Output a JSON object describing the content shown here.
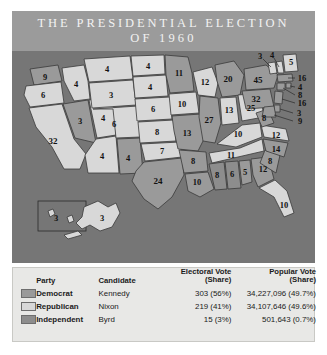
{
  "header": {
    "title_line1": "THE PRESIDENTIAL ELECTION",
    "title_line2": "OF 1960",
    "bar_color": "#9b9b9b"
  },
  "map": {
    "background_color": "#767676",
    "colors": {
      "democrat": "#9a9a9a",
      "republican": "#d8d8d8",
      "independent": "#8d8d8d",
      "border": "#3a3a3a"
    },
    "states": [
      {
        "code": "WA",
        "electoral_votes": "9",
        "party": "democrat"
      },
      {
        "code": "OR",
        "electoral_votes": "6",
        "party": "republican"
      },
      {
        "code": "CA",
        "electoral_votes": "32",
        "party": "republican"
      },
      {
        "code": "NV",
        "electoral_votes": "3",
        "party": "democrat"
      },
      {
        "code": "ID",
        "electoral_votes": "4",
        "party": "republican"
      },
      {
        "code": "UT",
        "electoral_votes": "4",
        "party": "republican"
      },
      {
        "code": "AZ",
        "electoral_votes": "4",
        "party": "republican"
      },
      {
        "code": "MT",
        "electoral_votes": "4",
        "party": "republican"
      },
      {
        "code": "WY",
        "electoral_votes": "3",
        "party": "republican"
      },
      {
        "code": "CO",
        "electoral_votes": "6",
        "party": "republican"
      },
      {
        "code": "NM",
        "electoral_votes": "4",
        "party": "democrat"
      },
      {
        "code": "ND",
        "electoral_votes": "4",
        "party": "republican"
      },
      {
        "code": "SD",
        "electoral_votes": "4",
        "party": "republican"
      },
      {
        "code": "NE",
        "electoral_votes": "6",
        "party": "republican"
      },
      {
        "code": "KS",
        "electoral_votes": "8",
        "party": "republican"
      },
      {
        "code": "OK",
        "electoral_votes": "7",
        "party": "republican"
      },
      {
        "code": "TX",
        "electoral_votes": "24",
        "party": "democrat"
      },
      {
        "code": "MN",
        "electoral_votes": "11",
        "party": "democrat"
      },
      {
        "code": "IA",
        "electoral_votes": "10",
        "party": "republican"
      },
      {
        "code": "MO",
        "electoral_votes": "13",
        "party": "democrat"
      },
      {
        "code": "AR",
        "electoral_votes": "8",
        "party": "democrat"
      },
      {
        "code": "LA",
        "electoral_votes": "10",
        "party": "democrat"
      },
      {
        "code": "WI",
        "electoral_votes": "12",
        "party": "republican"
      },
      {
        "code": "IL",
        "electoral_votes": "27",
        "party": "democrat"
      },
      {
        "code": "MI",
        "electoral_votes": "20",
        "party": "democrat"
      },
      {
        "code": "IN",
        "electoral_votes": "13",
        "party": "republican"
      },
      {
        "code": "OH",
        "electoral_votes": "25",
        "party": "republican"
      },
      {
        "code": "KY",
        "electoral_votes": "10",
        "party": "republican"
      },
      {
        "code": "TN",
        "electoral_votes": "11",
        "party": "republican"
      },
      {
        "code": "MS",
        "electoral_votes": "8",
        "party": "independent"
      },
      {
        "code": "AL-D",
        "electoral_votes": "6",
        "party": "independent"
      },
      {
        "code": "AL-R",
        "electoral_votes": "5",
        "party": "democrat"
      },
      {
        "code": "GA",
        "electoral_votes": "12",
        "party": "democrat"
      },
      {
        "code": "FL",
        "electoral_votes": "10",
        "party": "republican"
      },
      {
        "code": "SC",
        "electoral_votes": "8",
        "party": "democrat"
      },
      {
        "code": "NC",
        "electoral_votes": "14",
        "party": "democrat"
      },
      {
        "code": "VA",
        "electoral_votes": "12",
        "party": "republican"
      },
      {
        "code": "WV",
        "electoral_votes": "8",
        "party": "democrat"
      },
      {
        "code": "PA",
        "electoral_votes": "32",
        "party": "democrat"
      },
      {
        "code": "NY",
        "electoral_votes": "45",
        "party": "democrat"
      },
      {
        "code": "VT",
        "electoral_votes": "3",
        "party": "republican"
      },
      {
        "code": "NH",
        "electoral_votes": "4",
        "party": "republican"
      },
      {
        "code": "ME",
        "electoral_votes": "5",
        "party": "republican"
      },
      {
        "code": "MA",
        "electoral_votes": "16",
        "party": "democrat"
      },
      {
        "code": "RI",
        "electoral_votes": "4",
        "party": "democrat"
      },
      {
        "code": "CT",
        "electoral_votes": "8",
        "party": "democrat"
      },
      {
        "code": "NJ",
        "electoral_votes": "16",
        "party": "democrat"
      },
      {
        "code": "DE",
        "electoral_votes": "3",
        "party": "democrat"
      },
      {
        "code": "MD",
        "electoral_votes": "9",
        "party": "democrat"
      },
      {
        "code": "AK",
        "electoral_votes": "3",
        "party": "republican"
      },
      {
        "code": "HI",
        "electoral_votes": "3",
        "party": "democrat"
      }
    ]
  },
  "legend": {
    "columns": {
      "swatch": "",
      "party": "Party",
      "candidate": "Candidate",
      "electoral_l1": "Electoral Vote",
      "electoral_l2": "(Share)",
      "popular_l1": "Popular Vote",
      "popular_l2": "(Share)"
    },
    "rows": [
      {
        "party": "Democrat",
        "candidate": "Kennedy",
        "electoral": "303 (56%)",
        "popular": "34,227,096 (49.7%)"
      },
      {
        "party": "Republican",
        "candidate": "Nixon",
        "electoral": "219 (41%)",
        "popular": "34,107,646 (49.6%)"
      },
      {
        "party": "Independent",
        "candidate": "Byrd",
        "electoral": "15 (3%)",
        "popular": "501,643 (0.7%)"
      }
    ]
  }
}
